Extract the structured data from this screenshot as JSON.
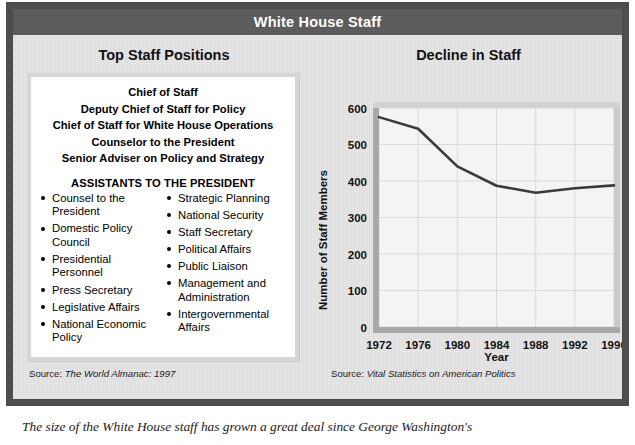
{
  "banner": {
    "title": "White House Staff"
  },
  "left": {
    "heading": "Top Staff Positions",
    "top_positions": [
      "Chief of Staff",
      "Deputy Chief of Staff for Policy",
      "Chief of Staff for White House Operations",
      "Counselor to the President",
      "Senior Adviser on Policy and Strategy"
    ],
    "assistants_heading": "ASSISTANTS TO THE PRESIDENT",
    "assistants_column_1": [
      "Counsel to the President",
      "Domestic Policy Council",
      "Presidential Personnel",
      "Press Secretary",
      "Legislative Affairs",
      "National Economic Policy"
    ],
    "assistants_column_2": [
      "Strategic Planning",
      "National Security",
      "Staff Secretary",
      "Political Affairs",
      "Public Liaison",
      "Management and Administration",
      "Intergovernmental Affairs"
    ],
    "source_label": "Source:",
    "source_title": "The World Almanac: 1997"
  },
  "right": {
    "heading": "Decline in Staff",
    "source_label": "Source:",
    "source_title": "Vital Statistics on American Politics"
  },
  "caption": "The size of the White House staff has grown a great deal since George Washington's",
  "colors": {
    "frame": "#4d4d4d",
    "banner": "#5b5b5b",
    "paper": "#e7e7e7",
    "box_border": "#d6d6d6",
    "line": "#3a3a3a",
    "grid": "#d9d9d9",
    "axis": "#a8a8a8"
  },
  "chart_data": {
    "type": "line",
    "title": "Decline in Staff",
    "xlabel": "Year",
    "ylabel": "Number of Staff Members",
    "x": [
      1972,
      1976,
      1980,
      1984,
      1988,
      1992,
      1996
    ],
    "values": [
      575,
      543,
      440,
      387,
      368,
      380,
      388
    ],
    "categories": [
      "1972",
      "1976",
      "1980",
      "1984",
      "1988",
      "1992",
      "1996"
    ],
    "xlim": [
      1972,
      1996
    ],
    "ylim": [
      0,
      600
    ],
    "ytick_labels": [
      "0",
      "100",
      "200",
      "300",
      "400",
      "500",
      "600"
    ],
    "yticks": [
      0,
      100,
      200,
      300,
      400,
      500,
      600
    ],
    "grid": true,
    "legend": "none",
    "series": [
      {
        "name": "Number of Staff Members",
        "values": [
          575,
          543,
          440,
          387,
          368,
          380,
          388
        ]
      }
    ]
  }
}
